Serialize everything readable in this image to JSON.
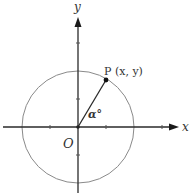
{
  "diagram": {
    "type": "unit-circle",
    "labels": {
      "x_axis": "x",
      "y_axis": "y",
      "origin": "O",
      "point": "P (x, y)",
      "angle": "α°"
    },
    "geometry": {
      "origin": [
        78,
        127
      ],
      "radius": 56,
      "point": [
        106,
        80
      ],
      "tick_spacing": 28
    },
    "colors": {
      "axis": "#2a2a2a",
      "circle": "#8a8a8a",
      "text": "#333333"
    }
  }
}
